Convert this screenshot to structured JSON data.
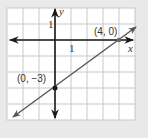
{
  "chart_data": {
    "type": "line",
    "title": "",
    "xlabel": "x",
    "ylabel": "y",
    "xlim": [
      -3,
      5
    ],
    "ylim": [
      -5,
      2
    ],
    "grid": true,
    "x_tick_labels": [
      "1"
    ],
    "y_tick_labels": [
      "1"
    ],
    "series": [
      {
        "name": "line",
        "points": [
          [
            0,
            -3
          ],
          [
            4,
            0
          ]
        ],
        "slope": 0.75,
        "intercept": -3
      }
    ],
    "annotations": [
      {
        "text": "(4, 0)",
        "x": 4,
        "y": 0
      },
      {
        "text": "(0, −3)",
        "x": 0,
        "y": -3
      }
    ]
  },
  "labels": {
    "x_axis": "x",
    "y_axis": "y",
    "x_tick": "1",
    "y_tick": "1",
    "point_a": "(4, 0)",
    "point_b": "(0, −3)"
  },
  "colors": {
    "background": "#e9e9e9",
    "grid_bg": "#ffffff",
    "grid_line": "#c8c8c8",
    "axis": "#1a1a1a",
    "line": "#555555",
    "point": "#1a1a1a"
  }
}
